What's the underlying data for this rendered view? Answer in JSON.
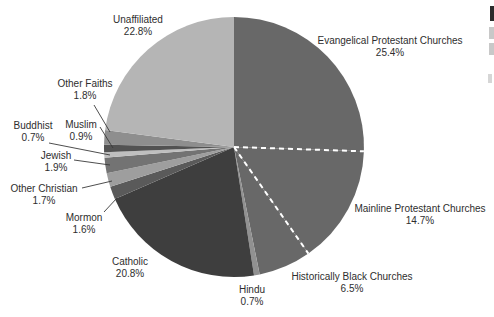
{
  "figure": {
    "background": "#ffffff",
    "text_color": "#2e2e2e",
    "leader_line_color": "#3a3a3a"
  },
  "chart_data": {
    "type": "pie",
    "title": "",
    "start_angle_deg": 0,
    "direction": "clockwise",
    "total_shown_pct": 99.5,
    "center": {
      "x": 234,
      "y": 147
    },
    "radius": 130,
    "separator_style": {
      "color": "#ffffff",
      "width": 2,
      "dash": "5 4"
    },
    "separators_after": [
      "Evangelical Protestant Churches",
      "Mainline Protestant Churches"
    ],
    "slices": [
      {
        "label": "Evangelical Protestant Churches",
        "value": 25.4,
        "pct_label": "25.4%",
        "color": "#686868",
        "label_x": 390,
        "label_y": 35
      },
      {
        "label": "Mainline Protestant Churches",
        "value": 14.7,
        "pct_label": "14.7%",
        "color": "#686868",
        "label_x": 420,
        "label_y": 203
      },
      {
        "label": "Historically Black Churches",
        "value": 6.5,
        "pct_label": "6.5%",
        "color": "#686868",
        "label_x": 352,
        "label_y": 271
      },
      {
        "label": "Hindu",
        "value": 0.7,
        "pct_label": "0.7%",
        "color": "#919191",
        "label_x": 252,
        "label_y": 284
      },
      {
        "label": "Catholic",
        "value": 20.8,
        "pct_label": "20.8%",
        "color": "#3e3e3e",
        "label_x": 130,
        "label_y": 256
      },
      {
        "label": "Mormon",
        "value": 1.6,
        "pct_label": "1.6%",
        "color": "#5a5a5a",
        "label_x": 84,
        "label_y": 212,
        "leader": {
          "x1": 104,
          "y1": 212,
          "x2": 117,
          "y2": 198
        }
      },
      {
        "label": "Other Christian",
        "value": 1.7,
        "pct_label": "1.7%",
        "color": "#9e9e9e",
        "label_x": 44,
        "label_y": 183,
        "leader": {
          "x1": 82,
          "y1": 188,
          "x2": 112,
          "y2": 181
        }
      },
      {
        "label": "Jewish",
        "value": 1.9,
        "pct_label": "1.9%",
        "color": "#737373",
        "label_x": 56,
        "label_y": 150,
        "leader": {
          "x1": 74,
          "y1": 160,
          "x2": 110,
          "y2": 165
        }
      },
      {
        "label": "Buddhist",
        "value": 0.7,
        "pct_label": "0.7%",
        "color": "#bfbfbf",
        "label_x": 33,
        "label_y": 120,
        "leader": {
          "x1": 49,
          "y1": 143,
          "x2": 110,
          "y2": 155
        }
      },
      {
        "label": "Muslim",
        "value": 0.9,
        "pct_label": "0.9%",
        "color": "#525252",
        "label_x": 81,
        "label_y": 119,
        "leader": {
          "x1": 100,
          "y1": 127,
          "x2": 113,
          "y2": 148
        }
      },
      {
        "label": "Other Faiths",
        "value": 1.8,
        "pct_label": "1.8%",
        "color": "#8e8e8e",
        "label_x": 85,
        "label_y": 78,
        "leader": {
          "x1": 94,
          "y1": 105,
          "x2": 110,
          "y2": 132
        }
      },
      {
        "label": "Unaffiliated",
        "value": 22.8,
        "pct_label": "22.8%",
        "color": "#b5b5b5",
        "label_x": 138,
        "label_y": 14
      }
    ]
  }
}
